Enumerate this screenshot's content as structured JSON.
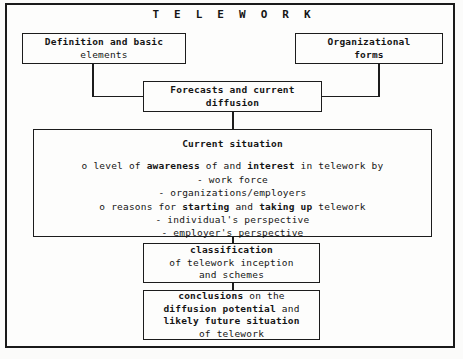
{
  "diagram": {
    "title": "T E L E W O R K",
    "colors": {
      "ink": "#1c1c1c",
      "paper": "#fdfdfc",
      "page_background": "#fbfbfa"
    },
    "boxes": {
      "definition": {
        "name": "Definition and basic elements",
        "lines": [
          "Definition and basic",
          "elements"
        ]
      },
      "organizational": {
        "name": "Organizational forms",
        "lines": [
          "Organizational",
          "forms"
        ]
      },
      "forecasts": {
        "name": "Forecasts and current diffusion",
        "lines": [
          "Forecasts and current",
          "diffusion"
        ]
      },
      "current_situation": {
        "heading": "Current situation",
        "bullets": [
          {
            "marker": "o",
            "parts": [
              {
                "text": "level of ",
                "bold": false
              },
              {
                "text": "awareness",
                "bold": true
              },
              {
                "text": " of and ",
                "bold": false
              },
              {
                "text": "interest",
                "bold": true
              },
              {
                "text": " in telework by",
                "bold": false
              }
            ],
            "plain": "o level of awareness of and interest in telework by",
            "sub": [
              "- work force",
              "- organizations/employers"
            ]
          },
          {
            "marker": "o",
            "parts": [
              {
                "text": "reasons for ",
                "bold": false
              },
              {
                "text": "starting",
                "bold": true
              },
              {
                "text": " and ",
                "bold": false
              },
              {
                "text": "taking up",
                "bold": true
              },
              {
                "text": " telework",
                "bold": false
              }
            ],
            "plain": "o reasons for starting and taking up telework",
            "sub": [
              "- individual's perspective",
              "- employer's perspective"
            ]
          }
        ]
      },
      "classification": {
        "lines": [
          {
            "text": "classification",
            "bold": true
          },
          {
            "text": "of telework inception",
            "bold": false
          },
          {
            "text": "and schemes",
            "bold": false
          }
        ]
      },
      "conclusions": {
        "lines": [
          {
            "text": "conclusions",
            "bold": true,
            "tail": " on the"
          },
          {
            "text": "diffusion potential",
            "bold": true,
            "tail": " and"
          },
          {
            "text": "likely future situation",
            "bold": true,
            "tail": ""
          },
          {
            "text": "of telework",
            "bold": false,
            "tail": ""
          }
        ]
      }
    },
    "connectors": [
      {
        "name": "definition-to-forecasts",
        "type": "elbow"
      },
      {
        "name": "organizational-to-forecasts",
        "type": "elbow"
      },
      {
        "name": "forecasts-to-current-situation",
        "type": "vertical"
      },
      {
        "name": "current-situation-to-classification",
        "type": "vertical"
      },
      {
        "name": "classification-to-conclusions",
        "type": "vertical"
      }
    ]
  }
}
